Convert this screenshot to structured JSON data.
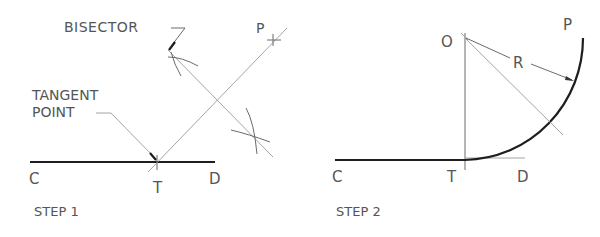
{
  "step1": {
    "caption": "STEP 1",
    "labels": {
      "bisector": "BISECTOR",
      "tangent_line1": "TANGENT",
      "tangent_line2": "POINT",
      "c": "C",
      "t": "T",
      "d": "D",
      "p": "P"
    }
  },
  "step2": {
    "caption": "STEP 2",
    "labels": {
      "o": "O",
      "r": "R",
      "p": "P",
      "c": "C",
      "t": "T",
      "d": "D"
    }
  },
  "colors": {
    "line": "#1e1e1e",
    "construction": "#9a9a9a",
    "text": "#555555"
  }
}
